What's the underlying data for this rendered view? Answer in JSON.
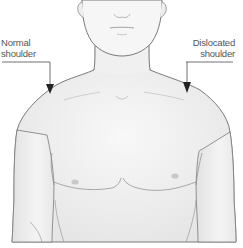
{
  "figure": {
    "labels": {
      "normal": {
        "line1": "Normal",
        "line2": "shoulder"
      },
      "dislocated": {
        "line1": "Dislocated",
        "line2": "shoulder"
      }
    },
    "colors": {
      "skin": "#f2f2f2",
      "outline": "#6b6b6b",
      "leader": "#333333",
      "label_text": "#555555",
      "shading": "#dcdcdc"
    }
  }
}
